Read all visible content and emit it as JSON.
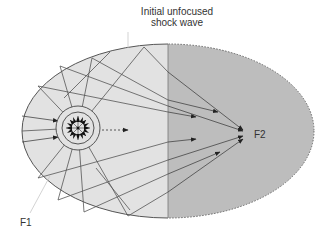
{
  "diagram": {
    "title_annotation": [
      "Initial unfocused",
      "shock wave"
    ],
    "focus_labels": {
      "f1": "F1",
      "f2": "F2"
    },
    "colors": {
      "left_fill": "#e2e2e2",
      "right_fill": "#bdbdbd",
      "stroke": "#555555",
      "arrow": "#222222",
      "leader": "#c8c8c8"
    },
    "ellipse": {
      "cx": 168,
      "cy": 131,
      "rx": 146,
      "ry": 87
    },
    "foci": {
      "f1": [
        78,
        128
      ],
      "f2": [
        245,
        133
      ]
    }
  }
}
